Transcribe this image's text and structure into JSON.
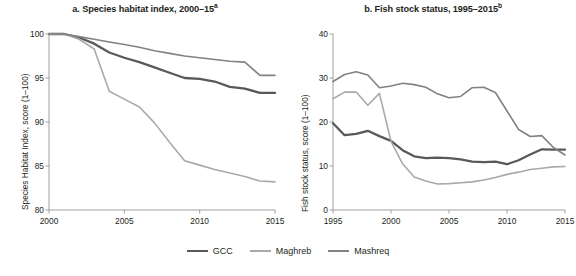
{
  "figure": {
    "legend": {
      "items": [
        {
          "label": "GCC",
          "color": "#58595b"
        },
        {
          "label": "Maghreb",
          "color": "#a7a9ac"
        },
        {
          "label": "Mashreq",
          "color": "#808285"
        }
      ]
    }
  },
  "chart_data": [
    {
      "type": "line",
      "panel": "a",
      "title": "a. Species habitat index, 2000–15",
      "title_superscript": "a",
      "xlabel": "",
      "ylabel": "Species Habitat Index, score (1–100)",
      "xlim": [
        2000,
        2015
      ],
      "ylim": [
        80,
        100
      ],
      "xticks": [
        2000,
        2005,
        2010,
        2015
      ],
      "xtick_labels": [
        "2000",
        "2005",
        "2010",
        "2015"
      ],
      "yticks": [
        80,
        85,
        90,
        95,
        100
      ],
      "ytick_labels": [
        "80",
        "85",
        "90",
        "95",
        "100"
      ],
      "grid": false,
      "legend_position": "bottom",
      "x": [
        2000,
        2001,
        2002,
        2003,
        2004,
        2005,
        2006,
        2007,
        2008,
        2009,
        2010,
        2011,
        2012,
        2013,
        2014,
        2015
      ],
      "series": [
        {
          "name": "GCC",
          "color": "#58595b",
          "values": [
            100.0,
            100.0,
            99.6,
            98.9,
            97.9,
            97.3,
            96.8,
            96.2,
            95.6,
            95.0,
            94.9,
            94.6,
            94.0,
            93.8,
            93.3,
            93.3
          ]
        },
        {
          "name": "Maghreb",
          "color": "#a7a9ac",
          "values": [
            100.0,
            100.0,
            99.4,
            98.3,
            93.5,
            92.6,
            91.7,
            89.9,
            87.7,
            85.6,
            85.1,
            84.6,
            84.2,
            83.8,
            83.3,
            83.2
          ]
        },
        {
          "name": "Mashreq",
          "color": "#808285",
          "values": [
            100.0,
            100.0,
            99.7,
            99.4,
            99.1,
            98.8,
            98.5,
            98.1,
            97.8,
            97.5,
            97.3,
            97.1,
            96.9,
            96.8,
            95.3,
            95.3
          ]
        }
      ]
    },
    {
      "type": "line",
      "panel": "b",
      "title": "b. Fish stock status, 1995–2015",
      "title_superscript": "b",
      "xlabel": "",
      "ylabel": "Fish stock status, score (1–100)",
      "xlim": [
        1995,
        2015
      ],
      "ylim": [
        0,
        40
      ],
      "xticks": [
        1995,
        2000,
        2005,
        2010,
        2015
      ],
      "xtick_labels": [
        "1995",
        "2000",
        "2005",
        "2010",
        "2015"
      ],
      "yticks": [
        0,
        10,
        20,
        30,
        40
      ],
      "ytick_labels": [
        "0",
        "10",
        "20",
        "30",
        "40"
      ],
      "grid": false,
      "legend_position": "bottom",
      "x": [
        1995,
        1996,
        1997,
        1998,
        1999,
        2000,
        2001,
        2002,
        2003,
        2004,
        2005,
        2006,
        2007,
        2008,
        2009,
        2010,
        2011,
        2012,
        2013,
        2014,
        2015
      ],
      "series": [
        {
          "name": "GCC",
          "color": "#58595b",
          "values": [
            19.7,
            17.0,
            17.3,
            18.0,
            16.8,
            15.7,
            13.6,
            12.2,
            11.8,
            11.9,
            11.8,
            11.5,
            11.0,
            10.9,
            11.0,
            10.4,
            11.3,
            12.6,
            13.8,
            13.7,
            13.7
          ]
        },
        {
          "name": "Maghreb",
          "color": "#a7a9ac",
          "values": [
            25.3,
            26.8,
            26.8,
            23.8,
            26.5,
            15.6,
            10.5,
            7.5,
            6.6,
            5.9,
            6.0,
            6.2,
            6.4,
            6.8,
            7.4,
            8.1,
            8.6,
            9.2,
            9.5,
            9.8,
            9.9
          ]
        },
        {
          "name": "Mashreq",
          "color": "#808285",
          "values": [
            29.2,
            30.8,
            31.4,
            30.7,
            27.8,
            28.2,
            28.8,
            28.5,
            27.9,
            26.4,
            25.5,
            25.8,
            27.8,
            27.9,
            26.7,
            22.5,
            18.3,
            16.7,
            16.9,
            14.2,
            12.5
          ]
        }
      ]
    }
  ]
}
